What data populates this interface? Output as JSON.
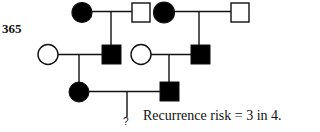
{
  "figure": {
    "number": "365",
    "caption": "Recurrence risk = 3 in 4.",
    "unknown_marker": "?"
  },
  "pedigree": {
    "line_color": "#111111",
    "fill_affected": "#000000",
    "fill_unaffected": "#ffffff",
    "generation_1": [
      {
        "id": "I-1",
        "sex": "female",
        "affected": true
      },
      {
        "id": "I-2",
        "sex": "male",
        "affected": false
      },
      {
        "id": "I-3",
        "sex": "female",
        "affected": true
      },
      {
        "id": "I-4",
        "sex": "male",
        "affected": false
      }
    ],
    "generation_2": [
      {
        "id": "II-1",
        "sex": "female",
        "affected": false
      },
      {
        "id": "II-2",
        "sex": "male",
        "affected": true,
        "parents": [
          "I-1",
          "I-2"
        ]
      },
      {
        "id": "II-3",
        "sex": "female",
        "affected": false
      },
      {
        "id": "II-4",
        "sex": "male",
        "affected": true,
        "parents": [
          "I-3",
          "I-4"
        ]
      }
    ],
    "generation_3": [
      {
        "id": "III-1",
        "sex": "female",
        "affected": true,
        "parents": [
          "II-1",
          "II-2"
        ]
      },
      {
        "id": "III-2",
        "sex": "male",
        "affected": true,
        "parents": [
          "II-3",
          "II-4"
        ]
      }
    ],
    "generation_4": [
      {
        "id": "IV-1",
        "sex": "unknown",
        "status": "?",
        "parents": [
          "III-1",
          "III-2"
        ]
      }
    ]
  }
}
